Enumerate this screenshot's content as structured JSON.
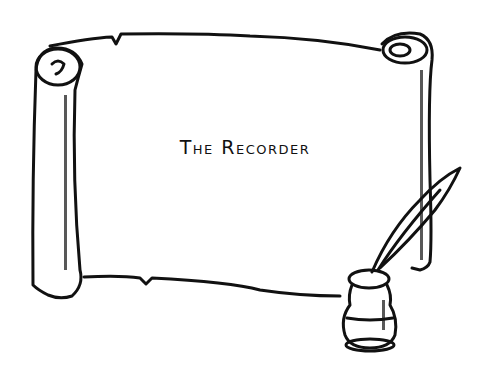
{
  "illustration": {
    "subject": "parchment scroll with quill and inkwell",
    "title": "The Recorder",
    "colors": {
      "ink": "#111111",
      "paper": "#ffffff"
    }
  }
}
